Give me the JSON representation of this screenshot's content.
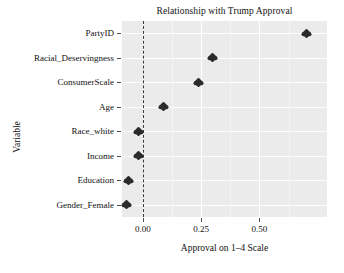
{
  "chart_data": {
    "type": "scatter",
    "title": "Relationship with Trump Approval",
    "xlabel": "Approval on 1–4 Scale",
    "ylabel": "Variable",
    "grid": true,
    "legend": null,
    "xlim": [
      -0.09,
      0.79
    ],
    "xticks": [
      0.0,
      0.25,
      0.5
    ],
    "xtick_labels": [
      "0.00",
      "0.25",
      "0.50"
    ],
    "reference_line": {
      "x": 0.0,
      "style": "dashed",
      "color": "#3a3a3a"
    },
    "categories": [
      "PartyID",
      "Racial_Deservingness",
      "ConsumerScale",
      "Age",
      "Race_white",
      "Income",
      "Education",
      "Gender_Female"
    ],
    "values": [
      0.7,
      0.3,
      0.24,
      0.09,
      -0.02,
      -0.02,
      -0.06,
      -0.07
    ],
    "points": [
      {
        "label": "PartyID",
        "value": 0.7
      },
      {
        "label": "Racial_Deservingness",
        "value": 0.3
      },
      {
        "label": "ConsumerScale",
        "value": 0.24
      },
      {
        "label": "Age",
        "value": 0.09
      },
      {
        "label": "Race_white",
        "value": -0.02
      },
      {
        "label": "Income",
        "value": -0.02
      },
      {
        "label": "Education",
        "value": -0.06
      },
      {
        "label": "Gender_Female",
        "value": -0.07
      }
    ],
    "marker": "diamond",
    "marker_color": "#2b2b2b",
    "panel_background": "#ebebeb",
    "gridline_color": "#ffffff"
  }
}
